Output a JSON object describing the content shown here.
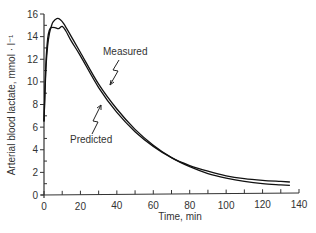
{
  "chart_data": {
    "type": "line",
    "title": "",
    "xlabel": "Time, min",
    "ylabel": "Arterial blood lactate, mmol · l⁻¹",
    "xlim": [
      0,
      140
    ],
    "ylim": [
      0,
      16
    ],
    "x_ticks": [
      0,
      20,
      40,
      60,
      80,
      100,
      120,
      140
    ],
    "y_ticks": [
      0,
      2,
      4,
      6,
      8,
      10,
      12,
      14,
      16
    ],
    "grid": false,
    "legend": "none (inline annotations)",
    "series": [
      {
        "name": "Measured",
        "x": [
          0,
          1,
          2,
          3,
          4,
          5,
          7,
          9,
          11,
          15,
          20,
          30,
          40,
          50,
          60,
          70,
          80,
          90,
          100,
          110,
          120,
          130,
          135
        ],
        "y": [
          6.5,
          11.0,
          13.2,
          14.3,
          14.9,
          15.3,
          15.6,
          15.5,
          15.1,
          14.0,
          12.6,
          9.8,
          7.6,
          5.8,
          4.4,
          3.3,
          2.5,
          1.9,
          1.5,
          1.2,
          1.0,
          0.9,
          0.85
        ]
      },
      {
        "name": "Predicted",
        "x": [
          0,
          1,
          2,
          3,
          4,
          6,
          8,
          10,
          12,
          15,
          20,
          30,
          40,
          50,
          60,
          70,
          80,
          90,
          100,
          110,
          120,
          130,
          135
        ],
        "y": [
          6.5,
          11.5,
          13.8,
          14.6,
          14.8,
          14.8,
          14.7,
          14.9,
          14.5,
          13.6,
          12.3,
          9.5,
          7.3,
          5.6,
          4.3,
          3.3,
          2.6,
          2.1,
          1.7,
          1.45,
          1.3,
          1.2,
          1.15
        ]
      }
    ],
    "annotations": [
      {
        "text": "Measured",
        "points_to": "Measured",
        "x": 42,
        "y": 8.2
      },
      {
        "text": "Predicted",
        "points_to": "Predicted",
        "x": 33,
        "y": 7.8
      }
    ]
  }
}
